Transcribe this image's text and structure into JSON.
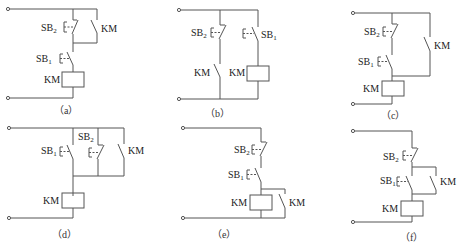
{
  "figure": {
    "panels": [
      {
        "id": "a",
        "caption": "（a）",
        "labels": {
          "sb2": "SB",
          "sb2_sub": "2",
          "sb1": "SB",
          "sb1_sub": "1",
          "km_contact": "KM",
          "km_coil": "KM"
        }
      },
      {
        "id": "b",
        "caption": "（b）",
        "labels": {
          "sb2": "SB",
          "sb2_sub": "2",
          "sb1": "SB",
          "sb1_sub": "1",
          "km_contact": "KM",
          "km_coil": "KM"
        }
      },
      {
        "id": "c",
        "caption": "（c）",
        "labels": {
          "sb2": "SB",
          "sb2_sub": "2",
          "sb1": "SB",
          "sb1_sub": "1",
          "km_contact": "KM",
          "km_coil": "KM"
        }
      },
      {
        "id": "d",
        "caption": "（d）",
        "labels": {
          "sb2": "SB",
          "sb2_sub": "2",
          "sb1": "SB",
          "sb1_sub": "1",
          "km_contact": "KM",
          "km_coil": "KM"
        }
      },
      {
        "id": "e",
        "caption": "（e）",
        "labels": {
          "sb2": "SB",
          "sb2_sub": "2",
          "sb1": "SB",
          "sb1_sub": "1",
          "km_contact": "KM",
          "km_coil": "KM"
        }
      },
      {
        "id": "f",
        "caption": "（f）",
        "labels": {
          "sb2": "SB",
          "sb2_sub": "2",
          "sb1": "SB",
          "sb1_sub": "1",
          "km_contact": "KM",
          "km_coil": "KM"
        }
      }
    ]
  }
}
